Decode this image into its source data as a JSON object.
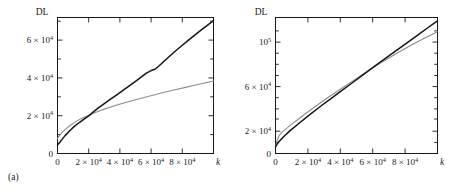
{
  "figure": {
    "panels": [
      {
        "id": "a",
        "caption": "(a)",
        "ylabel": "DL",
        "xlabel": "k"
      },
      {
        "id": "b",
        "caption": "(b)",
        "ylabel": "DL",
        "xlabel": "k"
      }
    ]
  },
  "chart_data": [
    {
      "type": "line",
      "panel": "(a)",
      "title": "",
      "xlabel": "k",
      "ylabel": "DL",
      "xlim": [
        0,
        100000
      ],
      "ylim": [
        0,
        72000
      ],
      "grid": false,
      "legend": "none",
      "xticks": [
        0,
        20000,
        40000,
        60000,
        80000
      ],
      "xticklabels": [
        "0",
        "2 × 10⁴",
        "4 × 10⁴",
        "6 × 10⁴",
        "8 × 10⁴"
      ],
      "yticks": [
        0,
        20000,
        40000,
        60000
      ],
      "yticklabels": [
        "0",
        "2 × 10⁴",
        "4 × 10⁴",
        "6 × 10⁴"
      ],
      "series": [
        {
          "name": "dark-curve",
          "color": "#151515",
          "x": [
            0,
            1500,
            3000,
            5000,
            8000,
            11000,
            14000,
            17000,
            20000,
            23000,
            26000,
            30000,
            34000,
            38000,
            42000,
            46000,
            50000,
            54000,
            57000,
            60000,
            62500,
            65000,
            68000,
            72000,
            76000,
            80000,
            84000,
            88000,
            92000,
            96000,
            100000
          ],
          "y": [
            4500,
            6000,
            7600,
            9600,
            12200,
            14500,
            16400,
            18200,
            19900,
            22000,
            24000,
            26400,
            28800,
            31100,
            33400,
            35800,
            38200,
            40700,
            42500,
            43900,
            44600,
            46300,
            48600,
            51600,
            54500,
            57300,
            60000,
            62700,
            65300,
            67800,
            70300
          ]
        },
        {
          "name": "light-curve",
          "color": "#8c8c8c",
          "x": [
            0,
            1500,
            3000,
            5000,
            8000,
            12000,
            16000,
            20000,
            25000,
            30000,
            36000,
            42000,
            50000,
            58000,
            66000,
            74000,
            82000,
            90000,
            100000
          ],
          "y": [
            8000,
            9800,
            11200,
            12800,
            14800,
            17000,
            18800,
            20300,
            22000,
            23500,
            25100,
            26600,
            28500,
            30200,
            31900,
            33500,
            35000,
            36500,
            38400
          ]
        }
      ]
    },
    {
      "type": "line",
      "panel": "(b)",
      "title": "",
      "xlabel": "k",
      "ylabel": "DL",
      "xlim": [
        0,
        100000
      ],
      "ylim": [
        0,
        122000
      ],
      "grid": false,
      "legend": "none",
      "xticks": [
        0,
        20000,
        40000,
        60000,
        80000
      ],
      "xticklabels": [
        "0",
        "2 × 10⁴",
        "4 × 10⁴",
        "6 × 10⁴",
        "8 × 10⁴"
      ],
      "yticks": [
        0,
        20000,
        60000,
        100000
      ],
      "yticklabels": [
        "0",
        "2 × 10⁴",
        "6 × 10⁴",
        "10⁵"
      ],
      "series": [
        {
          "name": "dark-curve",
          "color": "#151515",
          "x": [
            0,
            1000,
            2500,
            5000,
            9000,
            14000,
            20000,
            27000,
            34000,
            40000,
            47000,
            54000,
            60000,
            64000,
            70000,
            76000,
            82000,
            88000,
            94000,
            100000
          ],
          "y": [
            6000,
            8500,
            11200,
            15000,
            20500,
            26500,
            33500,
            41500,
            49000,
            55500,
            63000,
            70500,
            77000,
            81200,
            87500,
            93800,
            100200,
            106500,
            112800,
            119000
          ]
        },
        {
          "name": "light-curve",
          "color": "#8c8c8c",
          "x": [
            0,
            800,
            2000,
            4000,
            7000,
            11000,
            16000,
            22000,
            28000,
            34000,
            40000,
            47000,
            54000,
            60000,
            64000,
            70000,
            76000,
            82000,
            88000,
            94000,
            100000
          ],
          "y": [
            6000,
            11000,
            15500,
            19000,
            22800,
            27500,
            33000,
            39500,
            45800,
            51800,
            57700,
            64500,
            71200,
            76800,
            80400,
            85700,
            90800,
            95700,
            100400,
            104900,
            109200
          ]
        }
      ]
    }
  ]
}
